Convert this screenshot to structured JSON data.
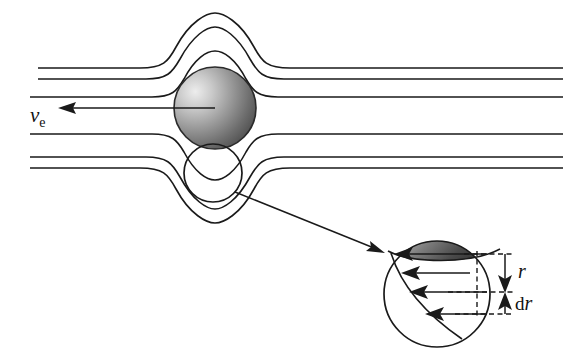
{
  "figure": {
    "background_color": "#ffffff",
    "ink_color": "#1a1a1a",
    "width": 563,
    "height": 355
  },
  "labels": {
    "velocity_symbol": "v",
    "velocity_subscript": "e",
    "radius_symbol": "r",
    "differential_prefix": "d",
    "differential_symbol": "r"
  },
  "main_view": {
    "sphere": {
      "name": "evaporating-sphere",
      "center_x": 215,
      "center_y": 108,
      "radius": 41,
      "shading": "gradient light-upper-left to dark-right",
      "light_color": "#e8e8e8",
      "mid_color": "#8a8a8a",
      "dark_color": "#3a3a3a"
    },
    "magnifier_circle": {
      "name": "magnifier-region",
      "center_x": 213,
      "center_y": 173,
      "radius": 29
    },
    "velocity_arrow": {
      "name": "velocity-arrow",
      "tail_x": 215,
      "tail_y": 108,
      "tip_x": 62,
      "tip_y": 108,
      "direction": "left"
    },
    "leader_arrow": {
      "name": "inset-leader-arrow",
      "tail_x": 235,
      "tail_y": 192,
      "tip_x": 382,
      "tip_y": 252
    },
    "streamlines": [
      {
        "name": "streamline-1",
        "offset": 74,
        "left_x": 38,
        "side": "top"
      },
      {
        "name": "streamline-2",
        "offset": 63,
        "left_x": 38,
        "side": "top"
      },
      {
        "name": "streamline-3",
        "offset": 41,
        "left_x": 30,
        "side": "top"
      },
      {
        "name": "streamline-4",
        "offset": 41,
        "left_x": 30,
        "side": "bottom"
      },
      {
        "name": "streamline-5",
        "offset": 63,
        "left_x": 30,
        "side": "bottom"
      },
      {
        "name": "streamline-6",
        "offset": 74,
        "left_x": 30,
        "side": "bottom"
      }
    ]
  },
  "inset_view": {
    "circle": {
      "name": "inset-boundary-circle",
      "center_x": 437,
      "center_y": 294,
      "radius": 53
    },
    "surface_cap": {
      "name": "sphere-surface-cap",
      "description": "dark gradient cap representing sphere surface at top of inset"
    },
    "velocity_profile": {
      "name": "velocity-profile",
      "description": "boundary layer velocity profile, arrows pointing left",
      "arrows": [
        {
          "name": "profile-arrow-1",
          "y": 254,
          "tip_x": 397,
          "tail_x": 487
        },
        {
          "name": "profile-arrow-2",
          "y": 273,
          "tip_x": 404,
          "tail_x": 470
        },
        {
          "name": "profile-arrow-3",
          "y": 292,
          "tip_x": 412,
          "tail_x": 487
        },
        {
          "name": "profile-arrow-4",
          "y": 314,
          "tip_x": 428,
          "tail_x": 487
        }
      ]
    },
    "dimension_r": {
      "name": "dimension-r",
      "top_y": 254,
      "bottom_y": 292,
      "arrow_direction": "down"
    },
    "dimension_dr": {
      "name": "dimension-dr",
      "top_y": 292,
      "bottom_y": 314,
      "arrow_direction": "up"
    }
  }
}
